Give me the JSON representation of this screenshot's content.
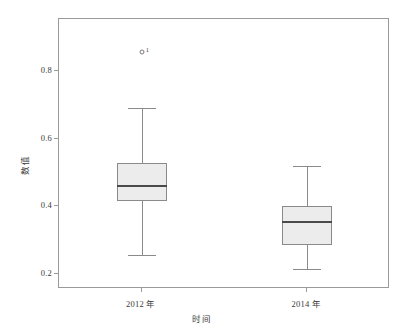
{
  "chart_data": {
    "type": "box",
    "title": "",
    "xlabel": "时间",
    "ylabel": "数值",
    "categories": [
      "2012 年",
      "2014 年"
    ],
    "ylim": [
      0.155,
      0.955
    ],
    "yticks": [
      0.2,
      0.4,
      0.6,
      0.8
    ],
    "ytick_labels": [
      "0.2",
      "0.4",
      "0.6",
      "0.8"
    ],
    "grid": false,
    "legend": "none",
    "boxes": [
      {
        "category": "2012 年",
        "whisker_low": 0.255,
        "q1": 0.415,
        "median": 0.461,
        "q3": 0.528,
        "whisker_high": 0.69,
        "outliers": [
          {
            "value": 0.857,
            "label": "1"
          }
        ]
      },
      {
        "category": "2014 年",
        "whisker_low": 0.215,
        "q1": 0.285,
        "median": 0.355,
        "q3": 0.4,
        "whisker_high": 0.52,
        "outliers": []
      }
    ]
  },
  "colors": {
    "box_fill": "#ececec",
    "box_border": "#8a8a8a",
    "median": "#4a4a4a",
    "frame": "#9a9a9a",
    "text": "#3a3a3a",
    "background": "#ffffff"
  }
}
